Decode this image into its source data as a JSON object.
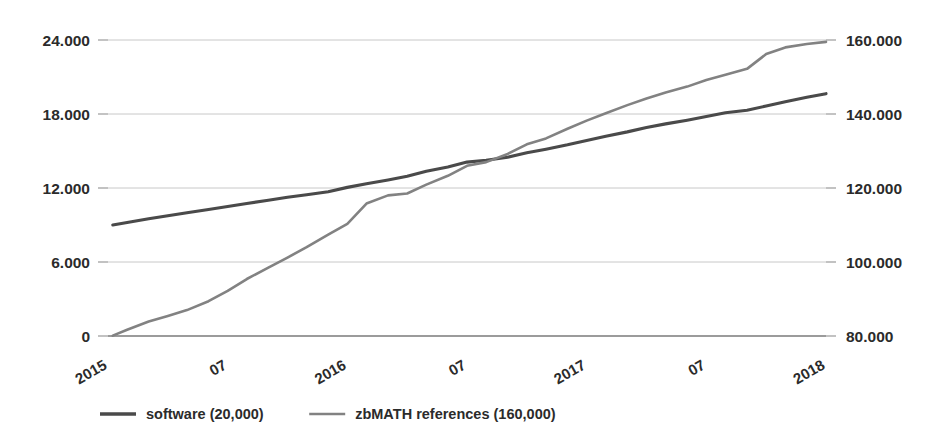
{
  "chart_data": {
    "type": "line",
    "title": "",
    "subtitle": "",
    "xlabel": "",
    "ylabel": "",
    "grid": true,
    "legend_position": "bottom",
    "x_tick_labels": [
      "2015",
      "07",
      "2016",
      "07",
      "2017",
      "07",
      "2018"
    ],
    "x_tick_positions": [
      0,
      0.5,
      1,
      1.5,
      2,
      2.5,
      3
    ],
    "x_axis_rotation_deg": -30,
    "left_axis": {
      "label": "software",
      "ticks": [
        "0",
        "6.000",
        "12.000",
        "18.000",
        "24.000"
      ],
      "tick_values": [
        0,
        6000,
        12000,
        18000,
        24000
      ],
      "ylim": [
        0,
        24000
      ]
    },
    "right_axis": {
      "label": "zbMATH references",
      "ticks": [
        "80.000",
        "100.000",
        "120.000",
        "140.000",
        "160.000"
      ],
      "tick_values": [
        80000,
        100000,
        120000,
        140000,
        160000
      ],
      "ylim": [
        80000,
        160000
      ]
    },
    "series": [
      {
        "name": "software (20,000)",
        "axis": "left",
        "color": "#4a4a4a",
        "stroke_width": 3.1,
        "x": [
          2015.02,
          2015.08,
          2015.17,
          2015.25,
          2015.33,
          2015.42,
          2015.5,
          2015.58,
          2015.67,
          2015.75,
          2015.83,
          2015.92,
          2016.0,
          2016.08,
          2016.17,
          2016.25,
          2016.33,
          2016.42,
          2016.5,
          2016.58,
          2016.67,
          2016.75,
          2016.83,
          2016.92,
          2017.0,
          2017.08,
          2017.17,
          2017.25,
          2017.33,
          2017.42,
          2017.5,
          2017.58,
          2017.67,
          2017.75,
          2017.83,
          2017.92,
          2018.0
        ],
        "values": [
          9000,
          9200,
          9500,
          9750,
          10000,
          10250,
          10500,
          10750,
          11000,
          11250,
          11450,
          11700,
          12050,
          12350,
          12650,
          12950,
          13350,
          13700,
          14100,
          14250,
          14500,
          14850,
          15150,
          15500,
          15850,
          16200,
          16550,
          16900,
          17200,
          17500,
          17800,
          18100,
          18300,
          18650,
          19000,
          19350,
          19650
        ]
      },
      {
        "name": "zbMATH references (160,000)",
        "axis": "right",
        "color": "#828282",
        "stroke_width": 2.6,
        "x": [
          2015.02,
          2015.08,
          2015.17,
          2015.25,
          2015.33,
          2015.42,
          2015.5,
          2015.58,
          2015.67,
          2015.75,
          2015.83,
          2015.92,
          2016.0,
          2016.08,
          2016.17,
          2016.25,
          2016.33,
          2016.42,
          2016.5,
          2016.58,
          2016.67,
          2016.75,
          2016.83,
          2016.92,
          2017.0,
          2017.08,
          2017.17,
          2017.25,
          2017.33,
          2017.42,
          2017.5,
          2017.58,
          2017.67,
          2017.75,
          2017.83,
          2017.92,
          2018.0
        ],
        "values": [
          80100,
          81700,
          83900,
          85400,
          87000,
          89400,
          92200,
          95400,
          98500,
          101200,
          104000,
          107400,
          110300,
          115800,
          118000,
          118500,
          120900,
          123300,
          126000,
          127000,
          129200,
          131800,
          133400,
          136000,
          138200,
          140200,
          142400,
          144200,
          145800,
          147400,
          149200,
          150600,
          152200,
          156200,
          158000,
          158900,
          159500
        ]
      }
    ],
    "legend": [
      {
        "label": "software (20,000)",
        "color": "#4a4a4a"
      },
      {
        "label": "zbMATH references (160,000)",
        "color": "#828282"
      }
    ]
  }
}
